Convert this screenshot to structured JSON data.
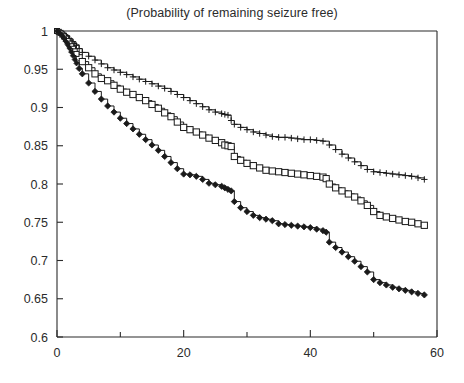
{
  "chart_data": {
    "type": "line",
    "title": "(Probability of remaining seizure free)",
    "xlabel": "",
    "ylabel": "",
    "xlim": [
      0,
      60
    ],
    "ylim": [
      0.6,
      1
    ],
    "grid": false,
    "legend": "none",
    "xticks": [
      0,
      20,
      40,
      60
    ],
    "xtick_labels": [
      "0",
      "20",
      "40",
      "60"
    ],
    "xminor_ticks": [
      10,
      30,
      50
    ],
    "yticks": [
      0.6,
      0.65,
      0.7,
      0.75,
      0.8,
      0.85,
      0.9,
      0.95,
      1
    ],
    "ytick_labels": [
      "0.6",
      "0.65",
      "0.7",
      "0.75",
      "0.8",
      "0.85",
      "0.9",
      "0.95",
      "1"
    ],
    "series": [
      {
        "name": "upper-curve",
        "marker": "plus",
        "x": [
          0,
          0.5,
          1,
          1.5,
          2,
          2.5,
          3,
          3.5,
          4,
          5,
          6,
          7,
          8,
          9,
          10,
          11,
          12,
          13,
          14,
          15,
          16,
          17,
          18,
          19,
          20,
          21,
          22,
          23,
          24,
          25,
          26,
          26.5,
          27,
          27.5,
          28,
          29,
          30,
          31,
          32,
          33,
          34,
          35,
          36,
          37,
          38,
          39,
          40,
          41,
          42,
          43,
          44,
          45,
          46,
          47,
          48,
          49,
          50,
          51,
          52,
          53,
          54,
          55,
          56,
          57,
          58
        ],
        "y": [
          1,
          0.999,
          0.997,
          0.994,
          0.99,
          0.986,
          0.982,
          0.977,
          0.972,
          0.967,
          0.962,
          0.957,
          0.952,
          0.949,
          0.946,
          0.943,
          0.94,
          0.937,
          0.934,
          0.931,
          0.928,
          0.925,
          0.921,
          0.917,
          0.913,
          0.909,
          0.905,
          0.901,
          0.897,
          0.894,
          0.892,
          0.891,
          0.89,
          0.883,
          0.878,
          0.874,
          0.871,
          0.868,
          0.866,
          0.864,
          0.862,
          0.861,
          0.861,
          0.86,
          0.859,
          0.858,
          0.858,
          0.857,
          0.856,
          0.851,
          0.845,
          0.839,
          0.834,
          0.829,
          0.824,
          0.819,
          0.816,
          0.815,
          0.814,
          0.813,
          0.812,
          0.811,
          0.81,
          0.808,
          0.806
        ]
      },
      {
        "name": "middle-curve",
        "marker": "square",
        "x": [
          0,
          0.5,
          1,
          1.5,
          2,
          2.5,
          3,
          3.5,
          4,
          5,
          6,
          7,
          8,
          9,
          10,
          11,
          12,
          13,
          14,
          15,
          16,
          17,
          18,
          19,
          20,
          21,
          22,
          23,
          24,
          25,
          26,
          26.5,
          27,
          27.5,
          28,
          29,
          30,
          31,
          32,
          33,
          34,
          35,
          36,
          37,
          38,
          39,
          40,
          41,
          42,
          42.5,
          43,
          44,
          45,
          46,
          47,
          48,
          49,
          50,
          51,
          52,
          53,
          54,
          55,
          56,
          57,
          58
        ],
        "y": [
          1,
          0.998,
          0.994,
          0.989,
          0.983,
          0.977,
          0.971,
          0.965,
          0.96,
          0.952,
          0.944,
          0.938,
          0.935,
          0.929,
          0.924,
          0.92,
          0.917,
          0.913,
          0.909,
          0.904,
          0.899,
          0.893,
          0.888,
          0.881,
          0.874,
          0.871,
          0.868,
          0.864,
          0.86,
          0.857,
          0.854,
          0.851,
          0.85,
          0.849,
          0.836,
          0.831,
          0.827,
          0.824,
          0.821,
          0.818,
          0.817,
          0.816,
          0.815,
          0.814,
          0.813,
          0.812,
          0.811,
          0.81,
          0.809,
          0.807,
          0.8,
          0.795,
          0.791,
          0.787,
          0.783,
          0.778,
          0.772,
          0.764,
          0.759,
          0.757,
          0.755,
          0.753,
          0.751,
          0.75,
          0.748,
          0.746
        ]
      },
      {
        "name": "lower-curve",
        "marker": "diamond",
        "x": [
          0,
          0.5,
          1,
          1.5,
          2,
          2.5,
          3,
          3.5,
          4,
          5,
          6,
          7,
          8,
          9,
          10,
          11,
          12,
          13,
          14,
          15,
          16,
          17,
          18,
          19,
          20,
          21,
          22,
          23,
          24,
          25,
          26,
          26.5,
          27,
          27.5,
          28,
          29,
          30,
          31,
          32,
          33,
          34,
          35,
          36,
          37,
          38,
          39,
          40,
          41,
          42,
          42.5,
          43,
          44,
          45,
          46,
          47,
          48,
          49,
          50,
          51,
          52,
          53,
          54,
          55,
          56,
          57,
          58
        ],
        "y": [
          1,
          0.997,
          0.992,
          0.985,
          0.977,
          0.968,
          0.959,
          0.951,
          0.944,
          0.932,
          0.921,
          0.911,
          0.902,
          0.894,
          0.886,
          0.879,
          0.872,
          0.865,
          0.858,
          0.851,
          0.844,
          0.836,
          0.828,
          0.82,
          0.813,
          0.812,
          0.81,
          0.806,
          0.801,
          0.799,
          0.797,
          0.795,
          0.793,
          0.791,
          0.777,
          0.769,
          0.764,
          0.759,
          0.756,
          0.754,
          0.752,
          0.748,
          0.747,
          0.746,
          0.745,
          0.744,
          0.743,
          0.741,
          0.739,
          0.737,
          0.724,
          0.717,
          0.711,
          0.705,
          0.699,
          0.692,
          0.685,
          0.675,
          0.671,
          0.668,
          0.665,
          0.663,
          0.661,
          0.659,
          0.657,
          0.655
        ]
      }
    ]
  },
  "axes": {
    "x_axis_name": "time-axis",
    "y_axis_name": "probability-axis"
  }
}
